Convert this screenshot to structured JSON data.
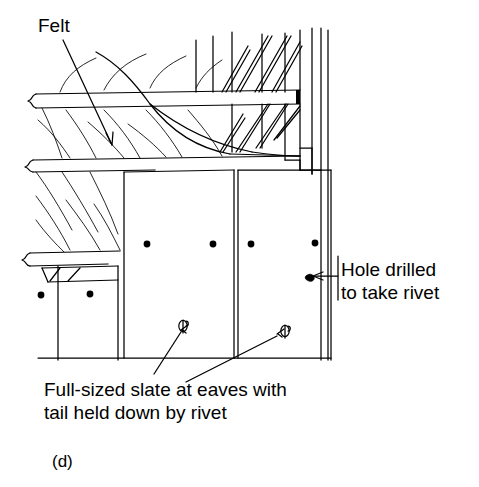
{
  "figure": {
    "kind": "technical-line-drawing",
    "figure_letter": "(d)",
    "stroke_color": "#000000",
    "background_color": "#ffffff"
  },
  "annotations": {
    "felt": {
      "text": "Felt",
      "leader": "arrow pointing down-right into felt layer"
    },
    "hole": {
      "line1": "Hole drilled",
      "line2": "to take rivet",
      "text": "Hole drilled\nto take rivet",
      "leader": "arrow pointing left to drilled hole in slate"
    },
    "slate": {
      "line1": "Full-sized slate at eaves with",
      "line2": "tail held down by rivet",
      "text": "Full-sized slate at eaves with\ntail held down by rivet",
      "leader": "two leaders pointing up to rivets at slate tails"
    }
  },
  "parts": {
    "felt_layer": "Felt",
    "battens": "Battens",
    "masonry_wall": "Masonry wall with diagonal hatching",
    "slates": "Slate courses",
    "rivets": "Rivets",
    "nail_holes": "Nail holes"
  },
  "counts": {
    "nail_holes_upper_row": 4,
    "nail_holes_lower_row": 2,
    "rivets": 2,
    "slate_panels": 3,
    "drilled_holes": 1
  }
}
